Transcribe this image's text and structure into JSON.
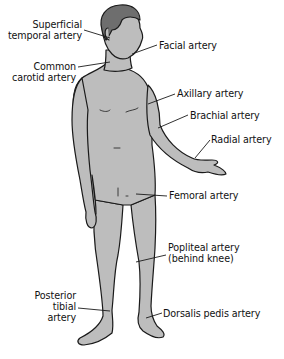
{
  "diagram": {
    "colors": {
      "body_fill": "#bdbdbd",
      "hair_fill": "#6e6e6e",
      "outline": "#1a1a1a",
      "background": "#ffffff",
      "text": "#111111"
    },
    "labels": [
      {
        "id": "superficial-temporal",
        "lines": [
          "Superficial",
          "temporal artery"
        ]
      },
      {
        "id": "common-carotid",
        "lines": [
          "Common",
          "carotid artery"
        ]
      },
      {
        "id": "facial",
        "lines": [
          "Facial artery"
        ]
      },
      {
        "id": "axillary",
        "lines": [
          "Axillary artery"
        ]
      },
      {
        "id": "brachial",
        "lines": [
          "Brachial artery"
        ]
      },
      {
        "id": "radial",
        "lines": [
          "Radial artery"
        ]
      },
      {
        "id": "femoral",
        "lines": [
          "Femoral artery"
        ]
      },
      {
        "id": "popliteal",
        "lines": [
          "Popliteal artery",
          "(behind knee)"
        ]
      },
      {
        "id": "posterior-tibial",
        "lines": [
          "Posterior",
          "tibial",
          "artery"
        ]
      },
      {
        "id": "dorsalis-pedis",
        "lines": [
          "Dorsalis pedis artery"
        ]
      }
    ]
  }
}
